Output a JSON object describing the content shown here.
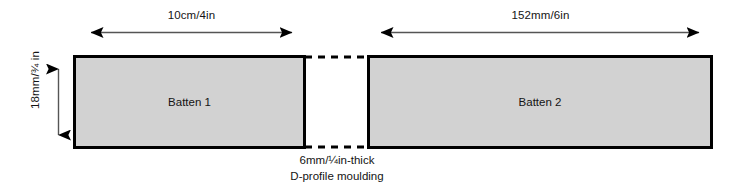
{
  "diagram": {
    "background_color": "#ffffff",
    "line_color": "#000000",
    "fill_color": "#d2d2d2",
    "text_color": "#141414"
  },
  "dimensions": {
    "width_left": "10cm/4in",
    "width_right": "152mm/6in",
    "height": "18mm/¾ in"
  },
  "parts": [
    {
      "label": "Batten 1"
    },
    {
      "label": "Batten 2"
    }
  ],
  "caption": {
    "line1": "6mm/¼in-thick",
    "line2": "D-profile moulding"
  }
}
